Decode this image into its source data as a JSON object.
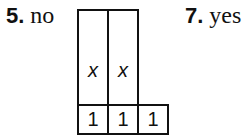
{
  "items": [
    {
      "number": "5.",
      "answer": "no"
    },
    {
      "number": "7.",
      "answer": "yes"
    }
  ],
  "model": {
    "tall_tiles": [
      {
        "label": "x"
      },
      {
        "label": "x"
      }
    ],
    "unit_tiles": [
      {
        "label": "1"
      },
      {
        "label": "1"
      },
      {
        "label": "1"
      }
    ]
  }
}
